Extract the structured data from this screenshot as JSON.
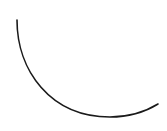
{
  "canvas": {
    "width": 167,
    "height": 131,
    "background": "#ffffff"
  },
  "shape": {
    "type": "arc",
    "stroke": "#1a1a1a",
    "stroke_width": 1.6,
    "start": [
      17,
      20
    ],
    "end": [
      158,
      104
    ],
    "radius": 97,
    "description": "open curved arc, lower-left quarter sweeping to lower-right"
  }
}
